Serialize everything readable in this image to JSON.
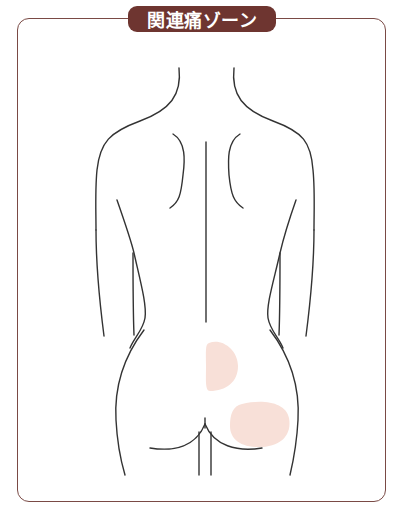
{
  "title": "関連痛ゾーン",
  "colors": {
    "frame": "#7a4a45",
    "badge": "#6e3530",
    "badge_text": "#ffffff",
    "body_outline": "#333333",
    "pain_zone": "#f8e0d8"
  },
  "figure": {
    "pain_zones": [
      {
        "name": "upper-buttock-zone",
        "label": ""
      },
      {
        "name": "lower-buttock-zone",
        "label": ""
      }
    ]
  }
}
